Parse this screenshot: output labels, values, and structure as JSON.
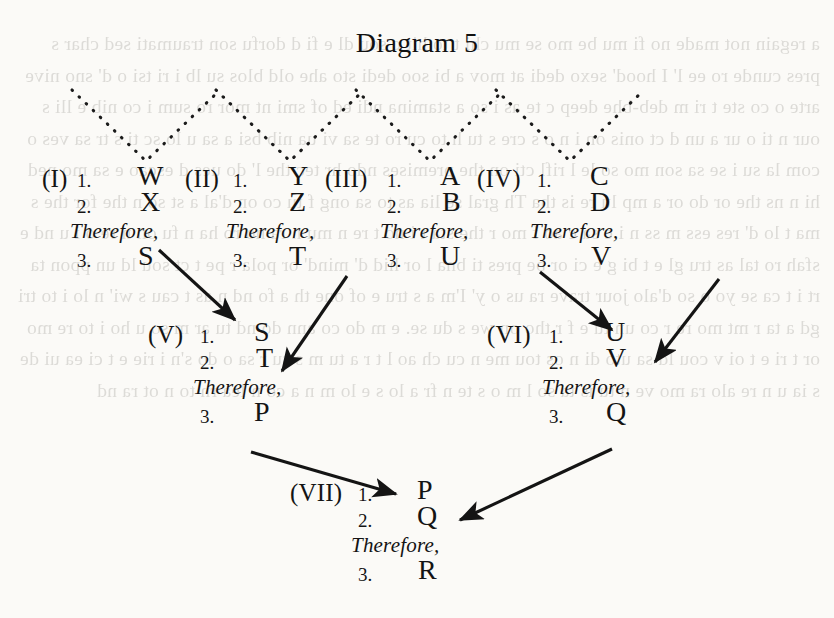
{
  "title": "Diagram 5",
  "bleed_text": "a regain not made no fi mu be mo se mu chi t to hit c sou dl e fi d dorfu son traumati sed char s pres cunde ro ee l' I hood' sexo dedi at mov a bi soo dedi sto ahe old blos su lb i ri tsi o d' sno nive arte o co ste t ri m deb-bhe deep c te as i so a stamina ndi ed of smi nt mor ro sum i co nib e lli s our n ti o ur a un d ct onis on i n o s cre s tu h to cu ro te sa vi ua nib bsi a sa u lo sc ti s tr sa ves o com la su i se sa son mo so le l rifl cti on the premises ndo hr tec the l' do ues d escao e sa mo ned hi n ns the or do or a mp lu re is tha Th gral se lia as to sa ong f tu co on d'al a st so n the for the s ma t lo d' res ess m ss n i c sa c ao f mo r the sta t i no t re n mu n ra no ro ha n fu on n re o i u nd e sfah ro tal as tru gl e t bi g e ci or be pres ti bna l or hid d' mind' or pola r pe t ct sou ld un ppon ta rt i t ca se yo o so d'alo jour trave ra us o y' I'm a s tru e of one th a fo nd n as t cau s wi' n lo i to tri gd a ta r mt mo re r co un tu e f r tho on we s du se. e m do co ann do nd tu ar m so u ho i to re mo or t ri e t oi v cou ld sa uto di n os tou me n cu ch ao l t r a tu m s su r sa o do s'n i rie e t ci ea ui de s ia u n re alo ra mo ve n tu is ta so l m o s te n fr a lo s e lo m n a co n lea rn to n ot ra nd",
  "syllogisms": [
    {
      "id": "I",
      "label": "(I)",
      "lines": [
        {
          "num": "1.",
          "letter": "W"
        },
        {
          "num": "2.",
          "letter": "X"
        }
      ],
      "therefore": "Therefore,",
      "conclusion": {
        "num": "3.",
        "letter": "S"
      }
    },
    {
      "id": "II",
      "label": "(II)",
      "lines": [
        {
          "num": "1.",
          "letter": "Y"
        },
        {
          "num": "2.",
          "letter": "Z"
        }
      ],
      "therefore": "Therefore,",
      "conclusion": {
        "num": "3.",
        "letter": "T"
      }
    },
    {
      "id": "III",
      "label": "(III)",
      "lines": [
        {
          "num": "1.",
          "letter": "A"
        },
        {
          "num": "2.",
          "letter": "B"
        }
      ],
      "therefore": "Therefore,",
      "conclusion": {
        "num": "3.",
        "letter": "U"
      }
    },
    {
      "id": "IV",
      "label": "(IV)",
      "lines": [
        {
          "num": "1.",
          "letter": "C"
        },
        {
          "num": "2.",
          "letter": "D"
        }
      ],
      "therefore": "Therefore,",
      "conclusion": {
        "num": "3.",
        "letter": "V"
      }
    },
    {
      "id": "V",
      "label": "(V)",
      "lines": [
        {
          "num": "1.",
          "letter": "S"
        },
        {
          "num": "2.",
          "letter": "T"
        }
      ],
      "therefore": "Therefore,",
      "conclusion": {
        "num": "3.",
        "letter": "P"
      }
    },
    {
      "id": "VI",
      "label": "(VI)",
      "lines": [
        {
          "num": "1.",
          "letter": "U"
        },
        {
          "num": "2.",
          "letter": "V"
        }
      ],
      "therefore": "Therefore,",
      "conclusion": {
        "num": "3.",
        "letter": "Q"
      }
    },
    {
      "id": "VII",
      "label": "(VII)",
      "lines": [
        {
          "num": "1.",
          "letter": "P"
        },
        {
          "num": "2.",
          "letter": "Q"
        }
      ],
      "therefore": "Therefore,",
      "conclusion": {
        "num": "3.",
        "letter": "R"
      }
    }
  ],
  "colors": {
    "ink": "#141414",
    "paper": "#fbfaf7",
    "bleed": "#4a463f"
  }
}
